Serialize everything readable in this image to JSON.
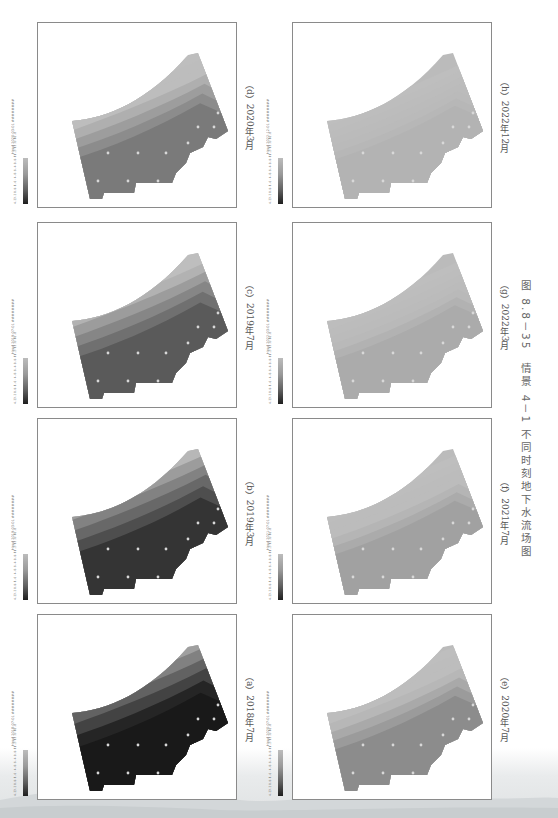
{
  "figure": {
    "caption": "图 8.8－35　情景 4－1 不同时刻地下水流场图",
    "orientation": "rotated 90° clockwise",
    "legend": {
      "values": [
        "4.2",
        "3.2",
        "0.8",
        "-1.6",
        "-4.0",
        "-6.4",
        "-8.8",
        "-11.2",
        "-13.6",
        "-16.0"
      ],
      "color_low": "#1e1e1e",
      "color_high": "#bcbcbc"
    },
    "panels": [
      {
        "id": "d",
        "subcaption": "（d）2020年3月",
        "head": "Head  2020-03-01 ########",
        "darkness": 0.55
      },
      {
        "id": "c",
        "subcaption": "（c）2019年7月",
        "head": "Head  2019-07-01 ########",
        "darkness": 0.7
      },
      {
        "id": "b",
        "subcaption": "（b）2019年3月",
        "head": "Head  2019-03-01 ########",
        "darkness": 0.85
      },
      {
        "id": "a",
        "subcaption": "（a）2018年7月",
        "head": "Head  2018-07-01 ########",
        "darkness": 1.0
      },
      {
        "id": "h",
        "subcaption": "（h）2022年12月",
        "head": "Head  2022-12-01 ########",
        "darkness": 0.1
      },
      {
        "id": "g",
        "subcaption": "（g）2022年3月",
        "head": "Head  2022-03-01 ########",
        "darkness": 0.2
      },
      {
        "id": "f",
        "subcaption": "（f）2021年7月",
        "head": "Head  2021-07-01 ########",
        "darkness": 0.3
      },
      {
        "id": "e",
        "subcaption": "（e）2020年7月",
        "head": "Head  2020-07-01 ########",
        "darkness": 0.45
      }
    ]
  }
}
